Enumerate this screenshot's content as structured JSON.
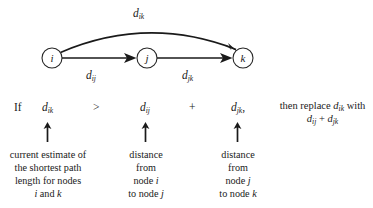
{
  "figure": {
    "type": "graph-triangle-inequality-diagram",
    "nodes": [
      {
        "id": "i",
        "label": "i",
        "cx": 52,
        "cy": 58,
        "r": 10
      },
      {
        "id": "j",
        "label": "j",
        "cx": 147,
        "cy": 58,
        "r": 10
      },
      {
        "id": "k",
        "label": "k",
        "cx": 243,
        "cy": 58,
        "r": 10
      }
    ],
    "edges": [
      {
        "id": "arc-ik",
        "from": "i",
        "to": "k",
        "shape": "arc",
        "label_base": "d",
        "label_sub": "ik"
      },
      {
        "id": "edge-ij",
        "from": "i",
        "to": "j",
        "shape": "straight",
        "label_base": "d",
        "label_sub": "ij"
      },
      {
        "id": "edge-jk",
        "from": "j",
        "to": "k",
        "shape": "straight",
        "label_base": "d",
        "label_sub": "jk"
      }
    ],
    "edge_labels": {
      "arc_ik": {
        "base": "d",
        "sub": "ik"
      },
      "edge_ij": {
        "base": "d",
        "sub": "ij"
      },
      "edge_jk": {
        "base": "d",
        "sub": "jk"
      }
    }
  },
  "formula": {
    "if_word": "If",
    "term1": {
      "base": "d",
      "sub": "ik"
    },
    "operator1": ">",
    "term2": {
      "base": "d",
      "sub": "ij"
    },
    "operator2": "+",
    "term3": {
      "base": "d",
      "sub": "jk"
    },
    "term3_punct": ",",
    "conclusion": {
      "lead": "then replace",
      "target": {
        "base": "d",
        "sub": "ik"
      },
      "tail": "with",
      "result_line": "d",
      "result_sub1": "ij",
      "result_plus": "+",
      "result_base2": "d",
      "result_sub2": "jk"
    }
  },
  "captions": [
    {
      "id": "caption-dik",
      "arrow": "up-arrow",
      "lines": [
        "current estimate of",
        "the shortest path",
        "length for nodes",
        "i and k"
      ],
      "italic_line_index": 3
    },
    {
      "id": "caption-dij",
      "arrow": "up-arrow",
      "lines": [
        "distance",
        "from",
        "node i",
        "to node j"
      ]
    },
    {
      "id": "caption-djk",
      "arrow": "up-arrow",
      "lines": [
        "distance",
        "from",
        "node j",
        "to node k"
      ]
    }
  ],
  "colors": {
    "ink": "#1a1a1a",
    "stroke": "#262626",
    "background": "#ffffff"
  }
}
